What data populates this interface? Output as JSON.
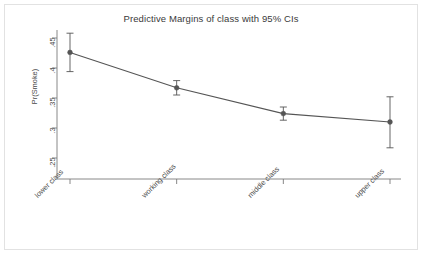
{
  "chart_data": {
    "type": "line",
    "title": "Predictive Margins of class with 95% CIs",
    "xlabel": "subjective class identification",
    "ylabel": "Pr(Smoke)",
    "categories": [
      "lower class",
      "working class",
      "middle class",
      "upper class"
    ],
    "values": [
      0.426,
      0.367,
      0.324,
      0.31
    ],
    "ci_low": [
      0.394,
      0.355,
      0.313,
      0.267
    ],
    "ci_high": [
      0.458,
      0.379,
      0.335,
      0.352
    ],
    "ylim": [
      0.235,
      0.468
    ],
    "yticks": [
      0.45,
      0.4,
      0.35,
      0.3,
      0.25
    ],
    "ytick_labels": [
      ".45",
      ".4",
      ".35",
      ".3",
      ".25"
    ],
    "grid": false,
    "legend": "none",
    "series": [
      {
        "name": "Pr(Smoke)",
        "values": [
          0.426,
          0.367,
          0.324,
          0.31
        ],
        "marker": "filled-circle",
        "color": "#555555"
      }
    ],
    "error_bars": "95% CI",
    "line_color": "#555555",
    "marker_color": "#555555",
    "axis_color": "#7a7a7a"
  },
  "figure": {
    "background": "#ffffff",
    "frame_color": "#e2e2e2"
  }
}
